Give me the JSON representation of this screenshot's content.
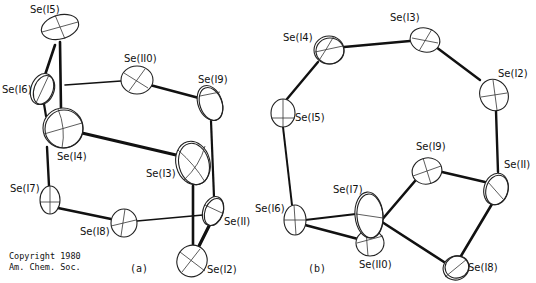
{
  "figure": {
    "panel_a": {
      "label": "(a)",
      "atoms": [
        {
          "id": "Se(I5)",
          "label": "Se(I5)"
        },
        {
          "id": "Se(I6)",
          "label": "Se(I6)"
        },
        {
          "id": "Se(I10)",
          "label": "Se(II0)"
        },
        {
          "id": "Se(I9)",
          "label": "Se(I9)"
        },
        {
          "id": "Se(I4)",
          "label": "Se(I4)"
        },
        {
          "id": "Se(I3)",
          "label": "Se(I3)"
        },
        {
          "id": "Se(I7)",
          "label": "Se(I7)"
        },
        {
          "id": "Se(I8)",
          "label": "Se(I8)"
        },
        {
          "id": "Se(I1)",
          "label": "Se(II)"
        },
        {
          "id": "Se(I2)",
          "label": "Se(I2)"
        }
      ],
      "bonds": [
        [
          "Se(I5)",
          "Se(I6)"
        ],
        [
          "Se(I5)",
          "Se(I4)"
        ],
        [
          "Se(I6)",
          "Se(I4)"
        ],
        [
          "Se(I10)",
          "Se(I6)"
        ],
        [
          "Se(I10)",
          "Se(I9)"
        ],
        [
          "Se(I9)",
          "Se(I1)"
        ],
        [
          "Se(I4)",
          "Se(I3)"
        ],
        [
          "Se(I4)",
          "Se(I7)"
        ],
        [
          "Se(I7)",
          "Se(I8)"
        ],
        [
          "Se(I8)",
          "Se(I1)"
        ],
        [
          "Se(I3)",
          "Se(I2)"
        ],
        [
          "Se(I1)",
          "Se(I2)"
        ]
      ]
    },
    "panel_b": {
      "label": "(b)",
      "atoms": [
        {
          "id": "Se(I4)",
          "label": "Se(I4)"
        },
        {
          "id": "Se(I3)",
          "label": "Se(I3)"
        },
        {
          "id": "Se(I2)",
          "label": "Se(I2)"
        },
        {
          "id": "Se(I5)",
          "label": "Se(I5)"
        },
        {
          "id": "Se(I9)",
          "label": "Se(I9)"
        },
        {
          "id": "Se(I1)",
          "label": "Se(II)"
        },
        {
          "id": "Se(I6)",
          "label": "Se(I6)"
        },
        {
          "id": "Se(I7)",
          "label": "Se(I7)"
        },
        {
          "id": "Se(I10)",
          "label": "Se(II0)"
        },
        {
          "id": "Se(I8)",
          "label": "Se(I8)"
        }
      ],
      "bonds": [
        [
          "Se(I5)",
          "Se(I4)"
        ],
        [
          "Se(I4)",
          "Se(I3)"
        ],
        [
          "Se(I3)",
          "Se(I2)"
        ],
        [
          "Se(I2)",
          "Se(I1)"
        ],
        [
          "Se(I5)",
          "Se(I6)"
        ],
        [
          "Se(I6)",
          "Se(I7)"
        ],
        [
          "Se(I6)",
          "Se(I10)"
        ],
        [
          "Se(I10)",
          "Se(I9)"
        ],
        [
          "Se(I9)",
          "Se(I1)"
        ],
        [
          "Se(I7)",
          "Se(I8)"
        ],
        [
          "Se(I1)",
          "Se(I8)"
        ]
      ]
    },
    "copyright": {
      "line1": "Copyright 1980",
      "line2": "Am. Chem. Soc."
    }
  }
}
